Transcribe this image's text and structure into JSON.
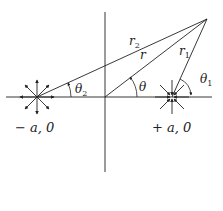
{
  "diagram": {
    "title": "",
    "points": {
      "source": {
        "label": "− a, 0",
        "x": 37,
        "y": 97,
        "type": "source"
      },
      "sink": {
        "label": "+ a, 0",
        "x": 172,
        "y": 97,
        "type": "sink"
      },
      "origin": {
        "x": 105,
        "y": 97
      },
      "P": {
        "x": 207,
        "y": 19
      }
    },
    "segments": {
      "r": "r",
      "r1": "r",
      "r2": "r",
      "r1_sub": "1",
      "r2_sub": "2"
    },
    "angles": {
      "theta": "θ",
      "theta1": "θ",
      "theta1_sub": "1",
      "theta2": "θ",
      "theta2_sub": "2"
    },
    "labels": {
      "minus_a": "− a, 0",
      "plus_a": "+ a, 0"
    },
    "colors": {
      "ink": "#222222",
      "background": "#ffffff"
    }
  }
}
